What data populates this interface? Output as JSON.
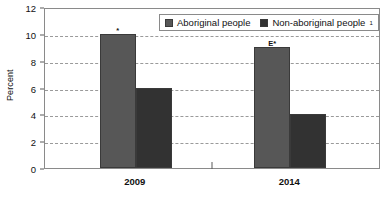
{
  "chart_data": {
    "type": "bar",
    "title": "",
    "subtitle": "",
    "xlabel": "",
    "ylabel": "Percent",
    "categories": [
      "2009",
      "2014"
    ],
    "ylim": [
      0,
      12
    ],
    "yticks": [
      0,
      2,
      4,
      6,
      8,
      10,
      12
    ],
    "ytick_labels": [
      "0",
      "2",
      "4",
      "6",
      "8",
      "10",
      "12"
    ],
    "grid": "horizontal-dashed",
    "legend_position": "top-right-inside",
    "series": [
      {
        "name": "Aboriginal people",
        "color": "#575757",
        "values": [
          10,
          9
        ],
        "annotations": [
          "*",
          "E*"
        ]
      },
      {
        "name": "Non-aboriginal people",
        "name_superscript": "1",
        "color": "#323232",
        "values": [
          6,
          4
        ],
        "annotations": [
          "",
          ""
        ]
      }
    ]
  },
  "legend": {
    "items": [
      {
        "label": "Aboriginal people",
        "sup": ""
      },
      {
        "label": "Non-aboriginal people",
        "sup": "1"
      }
    ]
  }
}
